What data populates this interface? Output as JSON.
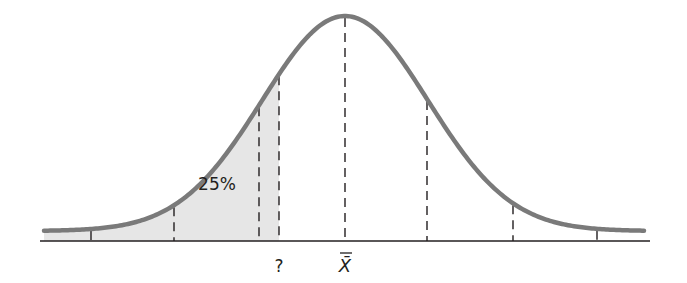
{
  "chart_data": {
    "type": "area",
    "title": "",
    "mean_label": "X̄",
    "unknown_label": "?",
    "shaded_area_label": "25%",
    "shaded_region": {
      "from": "left tail",
      "to": "?"
    },
    "dashed_line_positions_px": [
      91,
      174,
      259,
      279,
      345,
      427,
      513,
      597
    ],
    "axis": {
      "x_start_px": 40,
      "x_end_px": 650,
      "y_px": 241
    },
    "curve": {
      "mean_px": 345,
      "sigma_px": 83,
      "peak_y_px": 16,
      "tail_y_px": 231,
      "x_start_px": 44,
      "x_end_px": 645
    }
  },
  "colors": {
    "curve": "#7a7a7a",
    "shade": "#e6e6e6",
    "axis": "#231f20",
    "dash": "#231f20"
  }
}
